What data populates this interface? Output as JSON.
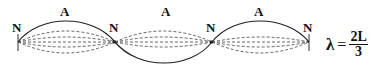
{
  "diagram": {
    "nodes": [
      {
        "label": "N",
        "x": 18
      },
      {
        "label": "N",
        "x": 115
      },
      {
        "label": "N",
        "x": 212
      },
      {
        "label": "N",
        "x": 309
      }
    ],
    "antinodes": [
      {
        "label": "A",
        "x": 66
      },
      {
        "label": "A",
        "x": 163
      },
      {
        "label": "A",
        "x": 260
      }
    ],
    "equation": {
      "symbol": "λ",
      "equals": "=",
      "numerator": "2L",
      "denominator": "3"
    },
    "colors": {
      "solid": "#222222",
      "dashed": "#555555"
    }
  }
}
